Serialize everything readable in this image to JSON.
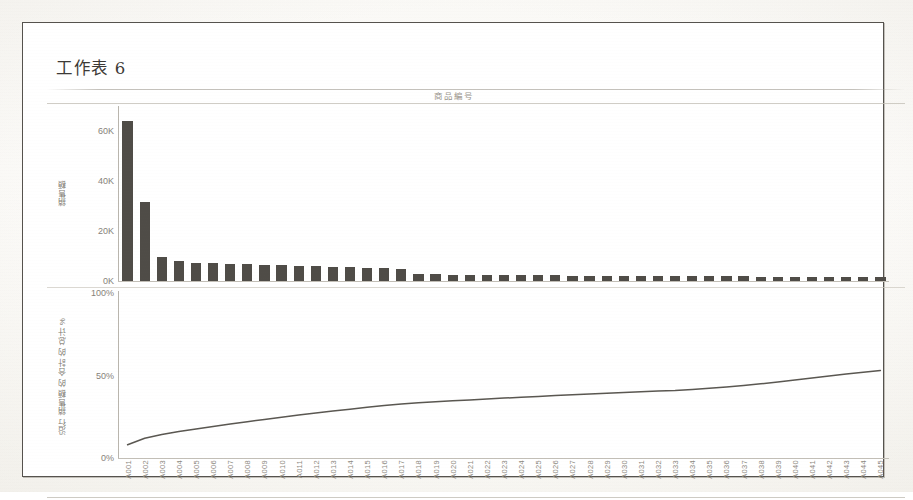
{
  "worksheet": {
    "title": "工作表 6",
    "column_header": "商品編号"
  },
  "colors": {
    "bar": "#4f4c47",
    "line": "#5a5751",
    "axis": "#b9b5ad",
    "text": "#86827a",
    "frame": "#55524d"
  },
  "bar_axis": {
    "label": "銷售額",
    "ticks": [
      "60K",
      "40K",
      "20K",
      "0K"
    ]
  },
  "line_axis": {
    "label": "沿行 銷售額 的 合計 的 总计 %",
    "ticks": [
      "100%",
      "50%",
      "0%"
    ]
  },
  "chart_data": [
    {
      "type": "bar",
      "title": "工作表 6",
      "xlabel": "商品編号",
      "ylabel": "銷售額",
      "ylim": [
        0,
        70000
      ],
      "grid": false,
      "tick_labels_y": [
        "0K",
        "20K",
        "40K",
        "60K"
      ],
      "tick_values_y": [
        0,
        20000,
        40000,
        60000
      ],
      "categories": [
        "A001",
        "A002",
        "A003",
        "A004",
        "A005",
        "A006",
        "A007",
        "A008",
        "A009",
        "A010",
        "A011",
        "A012",
        "A013",
        "A014",
        "A015",
        "A016",
        "A017",
        "A018",
        "A019",
        "A020",
        "A021",
        "A022",
        "A023",
        "A024",
        "A025",
        "A026",
        "A027",
        "A028",
        "A029",
        "A030",
        "A031",
        "A032",
        "A033",
        "A034",
        "A035",
        "A036",
        "A037",
        "A038",
        "A039",
        "A040",
        "A041",
        "A042",
        "A043",
        "A044",
        "A045"
      ],
      "values": [
        64000,
        31500,
        9800,
        8200,
        7400,
        7100,
        6900,
        6700,
        6500,
        6300,
        6100,
        5900,
        5700,
        5500,
        5300,
        5100,
        4900,
        3000,
        2700,
        2600,
        2500,
        2450,
        2400,
        2350,
        2300,
        2250,
        2200,
        2150,
        2100,
        2050,
        2000,
        1950,
        1900,
        1880,
        1860,
        1840,
        1820,
        1800,
        1780,
        1760,
        1740,
        1720,
        1700,
        1680,
        1660
      ]
    },
    {
      "type": "line",
      "title": "",
      "xlabel": "商品編号",
      "ylabel": "沿行 銷售額 的 合計 的 总计 %",
      "ylim": [
        0,
        100
      ],
      "grid": false,
      "tick_labels_y": [
        "0%",
        "50%",
        "100%"
      ],
      "tick_values_y": [
        0,
        50,
        100
      ],
      "categories": [
        "A001",
        "A002",
        "A003",
        "A004",
        "A005",
        "A006",
        "A007",
        "A008",
        "A009",
        "A010",
        "A011",
        "A012",
        "A013",
        "A014",
        "A015",
        "A016",
        "A017",
        "A018",
        "A019",
        "A020",
        "A021",
        "A022",
        "A023",
        "A024",
        "A025",
        "A026",
        "A027",
        "A028",
        "A029",
        "A030",
        "A031",
        "A032",
        "A033",
        "A034",
        "A035",
        "A036",
        "A037",
        "A038",
        "A039",
        "A040",
        "A041",
        "A042",
        "A043",
        "A044",
        "A045"
      ],
      "values": [
        8.0,
        12.0,
        14.2,
        16.0,
        17.6,
        19.1,
        20.6,
        22.0,
        23.4,
        24.7,
        26.0,
        27.2,
        28.4,
        29.6,
        30.7,
        31.8,
        32.8,
        33.5,
        34.1,
        34.7,
        35.2,
        35.8,
        36.3,
        36.8,
        37.3,
        37.8,
        38.3,
        38.8,
        39.2,
        39.7,
        40.1,
        40.6,
        41.0,
        41.6,
        42.3,
        43.1,
        44.0,
        45.0,
        46.1,
        47.3,
        48.5,
        49.7,
        50.9,
        52.0,
        53.0
      ]
    }
  ]
}
